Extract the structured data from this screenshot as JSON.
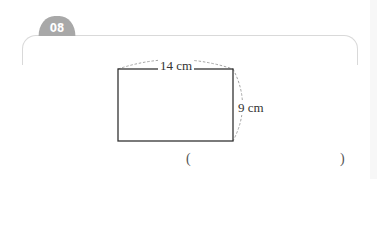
{
  "problem": {
    "number": "08",
    "badge_color": "#a8a8a8"
  },
  "figure": {
    "shape": "rectangle",
    "width_label": "14 cm",
    "height_label": "9 cm",
    "width_value": 14,
    "height_value": 9,
    "unit": "cm"
  },
  "answer": {
    "open_paren": "(",
    "close_paren": ")",
    "value": ""
  }
}
